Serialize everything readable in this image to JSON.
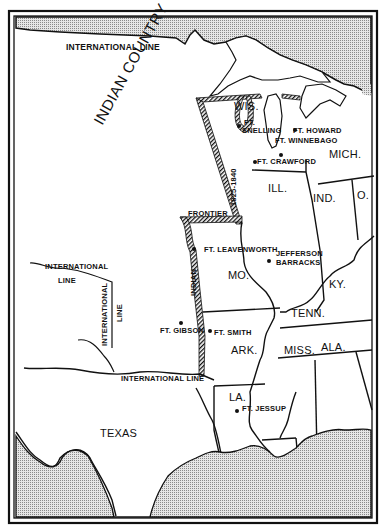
{
  "map": {
    "title": "Indian Country frontier 1825-1840",
    "colors": {
      "ink": "#111111",
      "water_stipple": "#bdbdbd",
      "paper": "#ffffff"
    },
    "region_labels": {
      "indian_country": "INDIAN COUNTRY",
      "texas": "TEXAS"
    },
    "state_labels": {
      "wis": "WIS.",
      "mich": "MICH.",
      "ill": "ILL.",
      "ind": "IND.",
      "ohio": "O.",
      "mo": "MO.",
      "ky": "KY.",
      "tenn": "TENN.",
      "ark": "ARK.",
      "miss": "MISS.",
      "ala": "ALA.",
      "la": "LA."
    },
    "boundary_labels": {
      "international_line_top": "INTERNATIONAL LINE",
      "international_line_west_1": "INTERNATIONAL",
      "international_line_west_2": "LINE",
      "international_line_vertical_1": "INTERNATIONAL",
      "international_line_vertical_2": "LINE",
      "international_line_south": "INTERNATIONAL LINE",
      "frontier": "FRONTIER",
      "frontier_dates": "1825-1840",
      "indian": "INDIAN"
    },
    "forts": [
      {
        "id": "snelling",
        "line1": "FT.",
        "line2": "SNELLING"
      },
      {
        "id": "howard",
        "label": "FT. HOWARD"
      },
      {
        "id": "winnebago",
        "label": "FT. WINNEBAGO"
      },
      {
        "id": "crawford",
        "label": "FT. CRAWFORD"
      },
      {
        "id": "leavenworth",
        "label": "FT. LEAVENWORTH"
      },
      {
        "id": "jefferson",
        "line1": "JEFFERSON",
        "line2": "BARRACKS"
      },
      {
        "id": "gibson",
        "label": "FT. GIBSON"
      },
      {
        "id": "smith",
        "label": "FT. SMITH"
      },
      {
        "id": "jessup",
        "label": "FT. JESSUP"
      }
    ]
  }
}
